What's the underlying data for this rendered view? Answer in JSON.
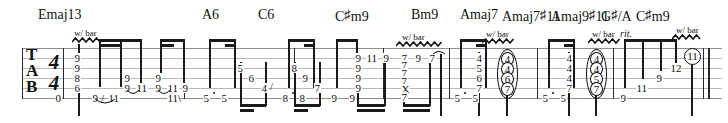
{
  "score": {
    "clef_label_lines": [
      "T",
      "A",
      "B"
    ],
    "time_signature": {
      "top": "4",
      "bottom": "4"
    },
    "tempo_markings": [
      {
        "text": "rit.",
        "x": 619
      }
    ],
    "technique_label": "w/ bar"
  },
  "chords": [
    {
      "name": "Emaj13",
      "root": "E",
      "quality": "maj13",
      "x": 38
    },
    {
      "name": "A6",
      "root": "A",
      "quality": "6",
      "x": 202
    },
    {
      "name": "C6",
      "root": "C",
      "quality": "6",
      "x": 258
    },
    {
      "name": "C#m9",
      "root": "C",
      "quality": "m9",
      "x": 337,
      "sharp": true
    },
    {
      "name": "Bm9",
      "root": "B",
      "quality": "m9",
      "x": 411
    },
    {
      "name": "Amaj7",
      "root": "A",
      "quality": "maj7",
      "x": 462
    },
    {
      "name": "Amaj7#11",
      "root": "A",
      "quality": "maj7#11",
      "x": 503,
      "sharp": true
    },
    {
      "name": "Amaj9#11",
      "root": "A",
      "quality": "maj9#11",
      "x": 554,
      "sharp": true
    },
    {
      "name": "G#/A",
      "root": "G",
      "quality": "/A",
      "x": 602,
      "sharp": true
    },
    {
      "name": "C#m9",
      "root": "C",
      "quality": "m9",
      "x": 637,
      "sharp": true
    }
  ],
  "bar_technique_markers": [
    {
      "label": "w/ bar",
      "x": 72,
      "y": 29,
      "squiggle_width": 28
    },
    {
      "label": "w/ bar",
      "x": 396,
      "y": 33,
      "squiggle_width": 46
    },
    {
      "label": "w/ bar",
      "x": 482,
      "y": 30,
      "squiggle_width": 33
    },
    {
      "label": "w/ bar",
      "x": 588,
      "y": 30,
      "squiggle_width": 33
    },
    {
      "label": "w/ bar",
      "x": 672,
      "y": 26,
      "squiggle_width": 30
    }
  ],
  "barlines_x": [
    63,
    184,
    294,
    383,
    449,
    537,
    613,
    703,
    709
  ],
  "tab_notes": [
    {
      "string": 6,
      "fret": "0",
      "x": 57,
      "measure": 1
    },
    {
      "string": 1,
      "fret": "9",
      "x": 76,
      "measure": 1
    },
    {
      "string": 2,
      "fret": "9",
      "x": 76,
      "measure": 1
    },
    {
      "string": 3,
      "fret": "8",
      "x": 76,
      "measure": 1
    },
    {
      "string": 4,
      "fret": "6",
      "x": 76,
      "measure": 1
    },
    {
      "string": 6,
      "fret": "9",
      "x": 96,
      "measure": 1
    },
    {
      "string": 6,
      "fret": "11",
      "x": 112,
      "measure": 1,
      "slide_from": true
    },
    {
      "string": 4,
      "fret": "9",
      "x": 126,
      "measure": 1
    },
    {
      "string": 5,
      "fret": "9",
      "x": 126,
      "measure": 1
    },
    {
      "string": 5,
      "fret": "11",
      "x": 140,
      "measure": 1
    },
    {
      "string": 4,
      "fret": "9",
      "x": 157,
      "measure": 1
    },
    {
      "string": 5,
      "fret": "9",
      "x": 157,
      "measure": 1
    },
    {
      "string": 5,
      "fret": "11",
      "x": 170,
      "measure": 1
    },
    {
      "string": 5,
      "fret": "9",
      "x": 185,
      "measure": 1
    },
    {
      "string": 6,
      "fret": "11",
      "x": 170,
      "measure": 1
    },
    {
      "string": 6,
      "fret": "5",
      "x": 204,
      "measure": 2
    },
    {
      "string": 6,
      "fret": "5",
      "x": 222,
      "measure": 2
    },
    {
      "string": 2,
      "fret": "5",
      "x": 238,
      "measure": 2
    },
    {
      "string": 3,
      "fret": "6",
      "x": 248,
      "measure": 2
    },
    {
      "string": 4,
      "fret": "4",
      "x": 260,
      "measure": 2,
      "slide": true
    },
    {
      "string": 6,
      "fret": "8",
      "x": 283,
      "measure": 3
    },
    {
      "string": 6,
      "fret": "8",
      "x": 300,
      "measure": 3
    },
    {
      "string": 2,
      "fret": "8",
      "x": 292,
      "measure": 3
    },
    {
      "string": 3,
      "fret": "9",
      "x": 303,
      "measure": 3
    },
    {
      "string": 4,
      "fret": "7",
      "x": 314,
      "measure": 3
    },
    {
      "string": 6,
      "fret": "9",
      "x": 332,
      "measure": 4
    },
    {
      "string": 6,
      "fret": "9",
      "x": 350,
      "measure": 4
    },
    {
      "string": 1,
      "fret": "9",
      "x": 358,
      "measure": 4
    },
    {
      "string": 2,
      "fret": "9",
      "x": 358,
      "measure": 4
    },
    {
      "string": 3,
      "fret": "9",
      "x": 358,
      "measure": 4
    },
    {
      "string": 4,
      "fret": "9",
      "x": 358,
      "measure": 4
    },
    {
      "string": 1,
      "fret": "11",
      "x": 371,
      "measure": 4
    },
    {
      "string": 1,
      "fret": "9",
      "x": 388,
      "measure": 4
    },
    {
      "string": 1,
      "fret": "7",
      "x": 403,
      "measure": 5
    },
    {
      "string": 2,
      "fret": "7",
      "x": 403,
      "measure": 5
    },
    {
      "string": 3,
      "fret": "7",
      "x": 403,
      "measure": 5
    },
    {
      "string": 4,
      "fret": "7",
      "x": 403,
      "measure": 5
    },
    {
      "string": 5,
      "fret": "X",
      "x": 403,
      "measure": 5
    },
    {
      "string": 6,
      "fret": "7",
      "x": 403,
      "measure": 5
    },
    {
      "string": 1,
      "fret": "9",
      "x": 417,
      "measure": 5
    },
    {
      "string": 1,
      "fret": "7",
      "x": 431,
      "measure": 5
    },
    {
      "string": 6,
      "fret": "5",
      "x": 455,
      "measure": 6
    },
    {
      "string": 6,
      "fret": "5",
      "x": 473,
      "measure": 6
    },
    {
      "string": 2,
      "fret": "4",
      "x": 478,
      "measure": 6
    },
    {
      "string": 3,
      "fret": "5",
      "x": 478,
      "measure": 6
    },
    {
      "string": 4,
      "fret": "6",
      "x": 478,
      "measure": 6
    },
    {
      "string": 5,
      "fret": "7",
      "x": 478,
      "measure": 6
    },
    {
      "string": 2,
      "fret": "4",
      "x": 505,
      "measure": 6,
      "circled": true
    },
    {
      "string": 3,
      "fret": "4",
      "x": 505,
      "measure": 6,
      "circled": true
    },
    {
      "string": 4,
      "fret": "6",
      "x": 505,
      "measure": 6,
      "circled": true
    },
    {
      "string": 5,
      "fret": "7",
      "x": 505,
      "measure": 6,
      "circled": true
    },
    {
      "string": 6,
      "fret": "5",
      "x": 543,
      "measure": 7
    },
    {
      "string": 6,
      "fret": "5",
      "x": 561,
      "measure": 7
    },
    {
      "string": 2,
      "fret": "4",
      "x": 568,
      "measure": 7
    },
    {
      "string": 3,
      "fret": "4",
      "x": 568,
      "measure": 7
    },
    {
      "string": 4,
      "fret": "4",
      "x": 568,
      "measure": 7
    },
    {
      "string": 5,
      "fret": "7",
      "x": 568,
      "measure": 7
    },
    {
      "string": 2,
      "fret": "4",
      "x": 594,
      "measure": 7,
      "circled": true
    },
    {
      "string": 3,
      "fret": "4",
      "x": 594,
      "measure": 7,
      "circled": true
    },
    {
      "string": 4,
      "fret": "5",
      "x": 594,
      "measure": 7,
      "circled": true
    },
    {
      "string": 5,
      "fret": "7",
      "x": 594,
      "measure": 7,
      "circled": true
    },
    {
      "string": 6,
      "fret": "9",
      "x": 621,
      "measure": 8
    },
    {
      "string": 5,
      "fret": "11",
      "x": 641,
      "measure": 8
    },
    {
      "string": 4,
      "fret": "9",
      "x": 659,
      "measure": 8
    },
    {
      "string": 3,
      "fret": "12",
      "x": 674,
      "measure": 8
    },
    {
      "string": 2,
      "fret": "11",
      "x": 690,
      "measure": 8,
      "circled": true
    }
  ]
}
